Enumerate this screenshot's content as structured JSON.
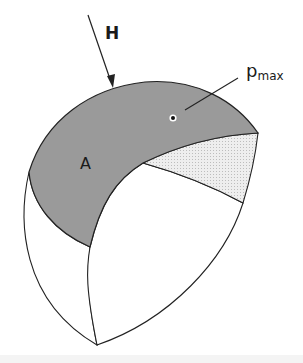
{
  "diagram": {
    "labels": {
      "force": "H",
      "area": "A",
      "pressure_main": "p",
      "pressure_sub": "max"
    },
    "colors": {
      "contact_area_fill": "#9a9a9a",
      "section_fill": "#e6e6e6",
      "body_fill": "#ffffff",
      "stroke": "#222222",
      "footer_band": "#f4f4f4"
    }
  }
}
